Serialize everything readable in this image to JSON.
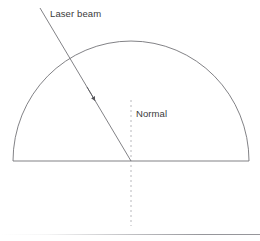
{
  "figure": {
    "background_color": "#ffffff",
    "width": 260,
    "height": 241,
    "labels": {
      "laser_beam": "Laser beam",
      "normal": "Normal"
    },
    "colors": {
      "stroke": "#6b6b70",
      "text": "#3a3a3a",
      "normal_dash": "#b8b8bc",
      "divider": "#969699"
    },
    "geometry": {
      "semicircle": {
        "center_x": 131,
        "center_y": 161,
        "radius_x": 118,
        "radius_y": 120,
        "baseline_y": 161,
        "left_x": 13,
        "right_x": 249,
        "apex_y": 41
      },
      "laser_beam": {
        "start_x": 40,
        "start_y": 8,
        "end_x": 131,
        "end_y": 161,
        "arrow_x": 94,
        "arrow_y": 99,
        "entry_x": 66,
        "entry_y": 62
      },
      "normal_line": {
        "x": 131,
        "top_y": 100,
        "bottom_y": 226,
        "dash": "2 3"
      },
      "divider_y": 234
    }
  }
}
